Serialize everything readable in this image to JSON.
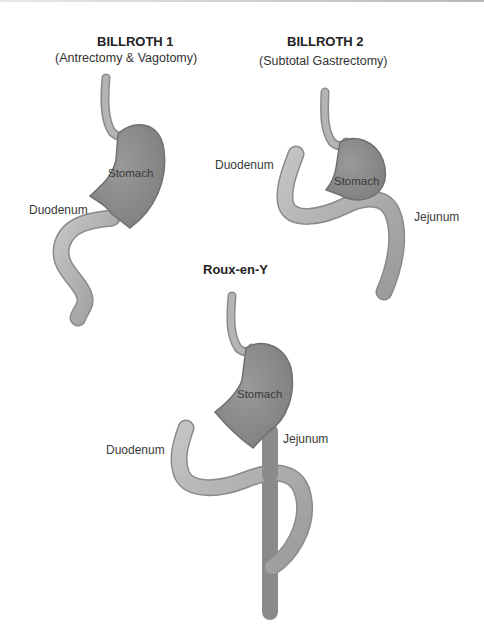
{
  "figures": [
    {
      "title": "BILLROTH 1",
      "subtitle": "(Antrectomy & Vagotomy)",
      "labels": {
        "stomach": "Stomach",
        "duodenum": "Duodenum"
      }
    },
    {
      "title": "BILLROTH 2",
      "subtitle": "(Subtotal Gastrectomy)",
      "labels": {
        "stomach": "Stomach",
        "duodenum": "Duodenum",
        "jejunum": "Jejunum"
      }
    },
    {
      "title": "Roux-en-Y",
      "labels": {
        "stomach": "Stomach",
        "duodenum": "Duodenum",
        "jejunum": "Jejunum"
      }
    }
  ],
  "colors": {
    "stomach_fill": "#8a8a8a",
    "intestine_fill": "#b0b0b0",
    "outline": "#6e6e6e",
    "background": "#ffffff"
  }
}
